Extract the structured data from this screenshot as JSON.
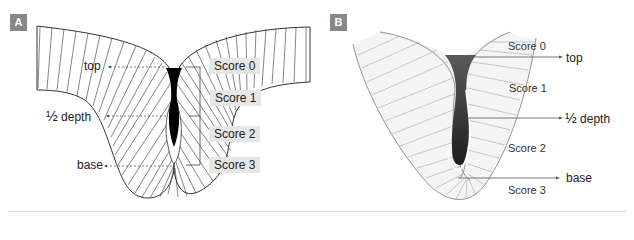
{
  "panels": [
    {
      "badge": "A",
      "labels": {
        "top": "top",
        "half_depth_frac": "½",
        "half_depth": "depth",
        "base": "base"
      },
      "scores": [
        "Score 0",
        "Score 1",
        "Score 2",
        "Score 3"
      ],
      "colors": {
        "badge": "#888888",
        "score_box": "#e6e6e6",
        "lumen": "#000000",
        "lines": "#222222"
      }
    },
    {
      "badge": "B",
      "labels": {
        "top": "top",
        "half_depth_frac": "½",
        "half_depth": "depth",
        "base": "base"
      },
      "scores": [
        "Score 0",
        "Score 1",
        "Score 2",
        "Score 3"
      ],
      "colors": {
        "badge": "#888888",
        "fill": "#f4f4f4",
        "lumen_top": "#5a5a5a",
        "lumen_bottom": "#222222",
        "lines": "#999999"
      }
    }
  ]
}
